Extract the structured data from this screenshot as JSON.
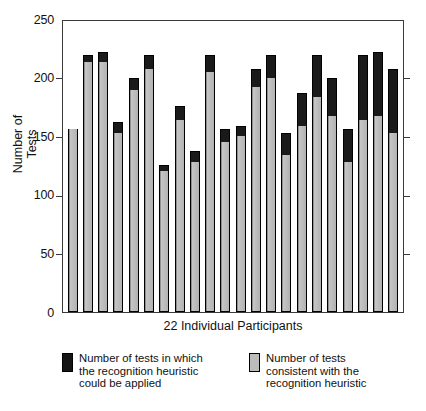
{
  "chart_data": {
    "type": "bar",
    "title": "",
    "subtitle": "",
    "xlabel": "22 Individual Participants",
    "ylabel": "Number of\nTests",
    "ylabel_line1": "Number of",
    "ylabel_line2": "Tests",
    "ylim": [
      0,
      250
    ],
    "yticks": [
      0,
      50,
      100,
      150,
      200,
      250
    ],
    "ytick_labels": [
      "0",
      "50",
      "100",
      "150",
      "200",
      "250"
    ],
    "grid": false,
    "stacked": true,
    "legend_position": "below",
    "categories": [
      "1",
      "2",
      "3",
      "4",
      "5",
      "6",
      "7",
      "8",
      "9",
      "10",
      "11",
      "12",
      "13",
      "14",
      "15",
      "16",
      "17",
      "18",
      "19",
      "20",
      "21",
      "22"
    ],
    "series": [
      {
        "name": "Number of tests consistent with the recognition heuristic",
        "color": "#b5b5b5",
        "values": [
          157,
          215,
          215,
          154,
          191,
          209,
          121,
          165,
          129,
          206,
          146,
          151,
          193,
          201,
          135,
          160,
          185,
          168,
          129,
          165,
          168,
          154
        ]
      },
      {
        "name": "Number of tests in which the recognition heuristic could be applied",
        "color": "#1a1a1a",
        "values": [
          157,
          221,
          223,
          163,
          201,
          221,
          126,
          177,
          138,
          221,
          157,
          160,
          209,
          221,
          154,
          188,
          221,
          201,
          157,
          221,
          223,
          209
        ]
      }
    ]
  },
  "axis": {
    "y_label_line1": "Number of",
    "y_label_line2": "Tests",
    "x_label": "22 Individual Participants",
    "tick_250": "250",
    "tick_200": "200",
    "tick_150": "150",
    "tick_100": "100",
    "tick_50": "50",
    "tick_0": "0"
  },
  "legend": {
    "items": [
      {
        "swatch": "black",
        "line1": "Number of tests in which",
        "line2": "the recognition heuristic",
        "line3": "could be applied"
      },
      {
        "swatch": "gray",
        "line1": "Number of tests",
        "line2": "consistent with the",
        "line3": "recognition heuristic"
      }
    ]
  }
}
